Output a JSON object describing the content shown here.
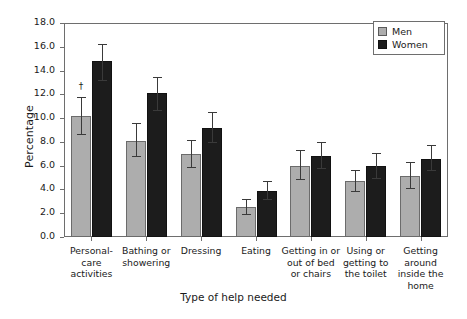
{
  "chart_data": {
    "type": "bar",
    "title": "",
    "subtitle": "",
    "xlabel": "Type of help needed",
    "ylabel": "Percentage",
    "ylim": [
      0.0,
      18.0
    ],
    "ytick_step": 2.0,
    "ytick_labels": [
      "0.0",
      "2.0",
      "4.0",
      "6.0",
      "8.0",
      "10.0",
      "12.0",
      "14.0",
      "16.0",
      "18.0"
    ],
    "ytick_values": [
      0.0,
      2.0,
      4.0,
      6.0,
      8.0,
      10.0,
      12.0,
      14.0,
      16.0,
      18.0
    ],
    "grid": false,
    "legend_position": "top-right",
    "categories": [
      "Personal-\ncare\nactivities",
      "Bathing or\nshowering",
      "Dressing",
      "Eating",
      "Getting in or\nout of bed\nor chairs",
      "Using or\ngetting to\nthe toilet",
      "Getting\naround\ninside the\nhome"
    ],
    "series": [
      {
        "name": "Men",
        "color": "#adadad",
        "values": [
          10.2,
          8.1,
          7.0,
          2.5,
          6.0,
          4.7,
          5.1
        ],
        "err_lower": [
          8.7,
          6.8,
          5.9,
          1.9,
          4.9,
          3.9,
          4.1
        ],
        "err_upper": [
          11.8,
          9.6,
          8.2,
          3.2,
          7.3,
          5.6,
          6.3
        ]
      },
      {
        "name": "Women",
        "color": "#1c1c1c",
        "values": [
          14.8,
          12.1,
          9.2,
          3.9,
          6.8,
          6.0,
          6.6
        ],
        "err_lower": [
          13.2,
          10.7,
          8.0,
          3.2,
          5.8,
          5.0,
          5.6
        ],
        "err_upper": [
          16.2,
          13.5,
          10.5,
          4.7,
          8.0,
          7.1,
          7.7
        ]
      }
    ],
    "annotations": [
      {
        "text": "†",
        "series": "Men",
        "category_index": 0,
        "value": 12.6
      }
    ]
  },
  "legend": {
    "items": [
      {
        "label": "Men",
        "swatch": "men-swatch"
      },
      {
        "label": "Women",
        "swatch": "women-swatch"
      }
    ]
  },
  "axes": {
    "y_title": "Percentage",
    "x_title": "Type of help needed"
  }
}
